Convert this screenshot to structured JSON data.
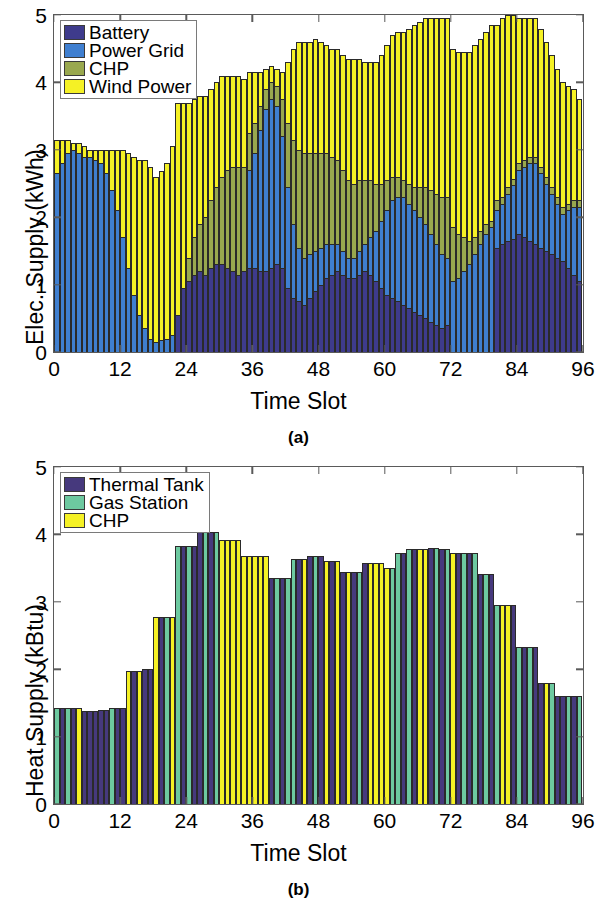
{
  "figure": {
    "panels": [
      {
        "id": "a",
        "caption": "(a)",
        "legend_position": "top-left",
        "chart_data": {
          "type": "bar",
          "subtype": "stacked",
          "title": "",
          "xlabel": "Time Slot",
          "ylabel": "Elec. Supply (kWh)",
          "xlim": [
            0,
            96
          ],
          "ylim": [
            0,
            5
          ],
          "xticks": [
            0,
            12,
            24,
            36,
            48,
            60,
            72,
            84,
            96
          ],
          "yticks": [
            0,
            1,
            2,
            3,
            4,
            5
          ],
          "xtick_labels": [
            "0",
            "12",
            "24",
            "36",
            "48",
            "60",
            "72",
            "84",
            "96"
          ],
          "ytick_labels": [
            "0",
            "1",
            "2",
            "3",
            "4",
            "5"
          ],
          "grid": false,
          "n_slots": 96,
          "legend": [
            "Battery",
            "Power Grid",
            "CHP",
            "Wind Power"
          ],
          "colors": [
            "#3e3b8c",
            "#3f7fd0",
            "#99a84e",
            "#f5f125"
          ],
          "series": [
            {
              "name": "Battery",
              "color": "#3e3b8c",
              "values": [
                0,
                0,
                0,
                0,
                0,
                0,
                0,
                0,
                0,
                0,
                0,
                0,
                0,
                0,
                0,
                0,
                0,
                0,
                0,
                0,
                0,
                0,
                0.55,
                0.95,
                1.05,
                1.15,
                1.2,
                1.15,
                1.25,
                1.3,
                1.3,
                1.25,
                1.2,
                1.15,
                1.2,
                1.25,
                1.25,
                1.2,
                1.2,
                1.25,
                1.3,
                1.25,
                0.95,
                0.8,
                0.75,
                0.7,
                0.8,
                0.9,
                1.0,
                1.1,
                1.15,
                1.2,
                1.15,
                1.1,
                1.1,
                1.15,
                1.2,
                1.15,
                1.05,
                0.95,
                0.85,
                0.8,
                0.75,
                0.7,
                0.65,
                0.6,
                0.55,
                0.5,
                0.45,
                0.4,
                0.35,
                0.4,
                0.0,
                0.0,
                0.0,
                0.0,
                0.0,
                0.0,
                0.0,
                0.0,
                1.55,
                1.6,
                1.65,
                1.7,
                1.75,
                1.7,
                1.65,
                1.6,
                1.55,
                1.5,
                1.45,
                1.4,
                1.35,
                1.25,
                1.15,
                1.05,
                0.95,
                0.9,
                0.85,
                0.8
              ]
            },
            {
              "name": "Power Grid",
              "color": "#3f7fd0",
              "values": [
                2.65,
                2.8,
                2.95,
                3.0,
                2.95,
                2.9,
                2.9,
                2.85,
                2.8,
                2.65,
                2.4,
                2.1,
                1.7,
                1.25,
                0.85,
                0.55,
                0.35,
                0.2,
                0.15,
                0.18,
                0.2,
                0.25,
                0.0,
                0.0,
                0.0,
                0.0,
                0.0,
                0.0,
                0.0,
                0.0,
                0.0,
                0.0,
                0.0,
                0.0,
                0.0,
                1.45,
                1.7,
                2.1,
                2.4,
                2.5,
                2.35,
                1.95,
                1.5,
                1.1,
                0.8,
                0.7,
                0.65,
                0.6,
                0.55,
                0.5,
                0.45,
                0.4,
                0.35,
                0.3,
                0.3,
                0.35,
                0.4,
                0.55,
                0.75,
                1.0,
                1.25,
                1.45,
                1.55,
                1.6,
                1.55,
                1.5,
                1.45,
                1.4,
                1.3,
                1.2,
                1.1,
                1.0,
                1.05,
                1.1,
                1.2,
                1.3,
                1.45,
                1.6,
                1.75,
                1.85,
                0.55,
                0.6,
                0.7,
                0.8,
                0.95,
                1.05,
                1.15,
                1.2,
                1.1,
                1.0,
                0.9,
                0.8,
                0.7,
                0.85,
                1.0,
                1.1,
                1.05,
                0.95,
                0.85,
                0.4
              ]
            },
            {
              "name": "CHP",
              "color": "#99a84e",
              "values": [
                0,
                0,
                0,
                0,
                0,
                0,
                0,
                0,
                0,
                0,
                0,
                0,
                0,
                0,
                0,
                0,
                0,
                0,
                0,
                0,
                0,
                0,
                0.0,
                0.0,
                0.35,
                0.55,
                0.7,
                0.85,
                1.0,
                1.15,
                1.3,
                1.45,
                1.55,
                1.6,
                1.55,
                0.55,
                0.45,
                0.35,
                0.3,
                0.25,
                0.3,
                0.55,
                0.95,
                1.25,
                1.45,
                1.55,
                1.5,
                1.45,
                1.4,
                1.35,
                1.3,
                1.25,
                1.2,
                1.15,
                1.1,
                1.05,
                0.95,
                0.85,
                0.7,
                0.55,
                0.45,
                0.35,
                0.3,
                0.25,
                0.3,
                0.35,
                0.45,
                0.55,
                0.65,
                0.75,
                0.85,
                0.9,
                0.8,
                0.65,
                0.5,
                0.35,
                0.25,
                0.2,
                0.15,
                0.1,
                0.15,
                0.1,
                0.1,
                0.1,
                0.1,
                0.1,
                0.1,
                0.1,
                0.1,
                0.1,
                0.1,
                0.1,
                0.1,
                0.1,
                0.1,
                0.1,
                0.1,
                0.1,
                0.1,
                0.1
              ]
            },
            {
              "name": "Wind Power",
              "color": "#f5f125",
              "values": [
                0.5,
                0.35,
                0.2,
                0.1,
                0.15,
                0.15,
                0.1,
                0.15,
                0.2,
                0.35,
                0.6,
                0.9,
                1.3,
                1.7,
                2.05,
                2.3,
                2.5,
                2.55,
                2.45,
                2.5,
                2.6,
                2.8,
                3.15,
                2.75,
                2.3,
                2.05,
                1.9,
                1.8,
                1.65,
                1.55,
                1.5,
                1.4,
                1.35,
                1.35,
                1.3,
                0.9,
                0.75,
                0.5,
                0.3,
                0.25,
                0.25,
                0.4,
                0.9,
                1.35,
                1.6,
                1.65,
                1.65,
                1.7,
                1.65,
                1.6,
                1.6,
                1.65,
                1.7,
                1.8,
                1.85,
                1.8,
                1.75,
                1.75,
                1.8,
                1.9,
                2.0,
                2.1,
                2.15,
                2.2,
                2.3,
                2.4,
                2.45,
                2.5,
                2.55,
                2.6,
                2.65,
                2.65,
                2.65,
                2.7,
                2.75,
                2.8,
                2.85,
                2.85,
                2.85,
                2.9,
                2.6,
                2.65,
                2.55,
                2.45,
                2.15,
                2.1,
                2.05,
                2.05,
                2.05,
                2.0,
                1.95,
                1.9,
                1.85,
                1.75,
                1.65,
                1.5,
                1.55,
                1.55,
                1.5,
                0.7
              ]
            }
          ]
        }
      },
      {
        "id": "b",
        "caption": "(b)",
        "legend_position": "top-left",
        "chart_data": {
          "type": "bar",
          "subtype": "overlaid",
          "title": "",
          "xlabel": "Time Slot",
          "ylabel": "Heat Supply (kBtu)",
          "xlim": [
            0,
            96
          ],
          "ylim": [
            0,
            5
          ],
          "xticks": [
            0,
            12,
            24,
            36,
            48,
            60,
            72,
            84,
            96
          ],
          "yticks": [
            0,
            1,
            2,
            3,
            4,
            5
          ],
          "xtick_labels": [
            "0",
            "12",
            "24",
            "36",
            "48",
            "60",
            "72",
            "84",
            "96"
          ],
          "ytick_labels": [
            "0",
            "1",
            "2",
            "3",
            "4",
            "5"
          ],
          "grid": false,
          "n_slots": 96,
          "legend": [
            "Thermal Tank",
            "Gas Station",
            "CHP"
          ],
          "colors": [
            "#46397d",
            "#6dc9a0",
            "#f5f125"
          ],
          "envelope": [
            1.43,
            1.43,
            1.43,
            1.43,
            1.43,
            1.38,
            1.38,
            1.38,
            1.4,
            1.4,
            1.42,
            1.42,
            1.43,
            1.98,
            1.98,
            1.98,
            2.0,
            2.0,
            2.77,
            2.77,
            2.77,
            2.77,
            3.83,
            3.83,
            3.83,
            3.83,
            4.03,
            4.03,
            4.03,
            4.03,
            3.92,
            3.92,
            3.92,
            3.92,
            3.68,
            3.68,
            3.68,
            3.68,
            3.68,
            3.36,
            3.36,
            3.36,
            3.36,
            3.63,
            3.63,
            3.63,
            3.68,
            3.68,
            3.68,
            3.6,
            3.6,
            3.6,
            3.44,
            3.44,
            3.44,
            3.44,
            3.57,
            3.57,
            3.57,
            3.57,
            3.5,
            3.5,
            3.72,
            3.72,
            3.78,
            3.78,
            3.78,
            3.78,
            3.8,
            3.8,
            3.78,
            3.78,
            3.72,
            3.72,
            3.72,
            3.72,
            3.72,
            3.42,
            3.42,
            3.42,
            2.95,
            2.95,
            2.95,
            2.95,
            2.33,
            2.33,
            2.33,
            2.33,
            1.8,
            1.8,
            1.8,
            1.6,
            1.6,
            1.6,
            1.6,
            1.6
          ],
          "bar_owner": [
            "gas",
            "tt",
            "gas",
            "tt",
            "chp",
            "tt",
            "tt",
            "tt",
            "tt",
            "tt",
            "gas",
            "tt",
            "tt",
            "chp",
            "tt",
            "chp",
            "tt",
            "tt",
            "chp",
            "tt",
            "gas",
            "chp",
            "gas",
            "tt",
            "gas",
            "tt",
            "tt",
            "gas",
            "tt",
            "gas",
            "chp",
            "chp",
            "chp",
            "chp",
            "chp",
            "chp",
            "chp",
            "chp",
            "chp",
            "tt",
            "gas",
            "tt",
            "gas",
            "gas",
            "tt",
            "chp",
            "tt",
            "gas",
            "tt",
            "chp",
            "tt",
            "chp",
            "tt",
            "chp",
            "tt",
            "gas",
            "tt",
            "chp",
            "chp",
            "chp",
            "chp",
            "gas",
            "gas",
            "tt",
            "gas",
            "tt",
            "chp",
            "chp",
            "tt",
            "gas",
            "tt",
            "gas",
            "chp",
            "tt",
            "gas",
            "tt",
            "gas",
            "tt",
            "gas",
            "tt",
            "gas",
            "chp",
            "chp",
            "tt",
            "gas",
            "tt",
            "gas",
            "tt",
            "tt",
            "chp",
            "gas",
            "tt",
            "tt",
            "gas",
            "tt",
            "gas"
          ]
        }
      }
    ]
  }
}
